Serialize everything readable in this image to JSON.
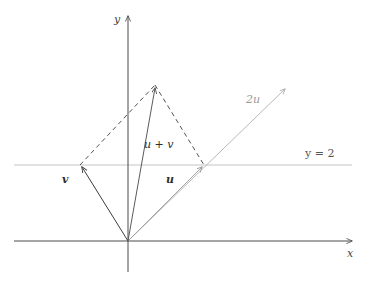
{
  "figure": {
    "background_color": "#ffffff"
  },
  "axes": {
    "x_label": "x",
    "y_label": "y",
    "axis_color": "#4a4a4a",
    "origin": {
      "x": 128,
      "y": 241
    },
    "x_axis": {
      "x_start": 14,
      "x_end": 356,
      "y": 241,
      "arrow": "right"
    },
    "y_axis": {
      "x": 128,
      "y_start": 272,
      "y_end": 12,
      "arrow": "up"
    }
  },
  "reference_line": {
    "label": "y = 2",
    "label_html": "y = 2",
    "y_pixel": 165,
    "x_start": 14,
    "x_end": 352,
    "color": "#b9b9b9"
  },
  "vectors": [
    {
      "name": "v",
      "label": "v",
      "from": {
        "x": 128,
        "y": 241
      },
      "to": {
        "x": 80,
        "y": 165
      },
      "style": "solid",
      "color": "#3d3d3d",
      "arrow": true,
      "label_pos": {
        "x": 62,
        "y": 174
      }
    },
    {
      "name": "u",
      "label": "u",
      "from": {
        "x": 128,
        "y": 241
      },
      "to": {
        "x": 204,
        "y": 165
      },
      "style": "solid",
      "color": "#9a9a9a",
      "arrow": true,
      "label_pos": {
        "x": 166,
        "y": 174
      }
    },
    {
      "name": "u-plus-v",
      "label": "u + v",
      "from": {
        "x": 128,
        "y": 241
      },
      "to": {
        "x": 155,
        "y": 85
      },
      "style": "solid",
      "color": "#5a5a5a",
      "arrow": true,
      "label_pos": {
        "x": 144,
        "y": 139
      }
    },
    {
      "name": "two-u",
      "label": "2u",
      "from": {
        "x": 128,
        "y": 241
      },
      "to": {
        "x": 288,
        "y": 86
      },
      "style": "solid",
      "color": "#b0b0b0",
      "arrow": true,
      "label_pos": {
        "x": 246,
        "y": 94
      }
    }
  ],
  "construction_lines": [
    {
      "name": "dashed-v-to-apex",
      "from": {
        "x": 80,
        "y": 165
      },
      "to": {
        "x": 155,
        "y": 85
      },
      "style": "dashed",
      "color": "#3d3d3d"
    },
    {
      "name": "dashed-apex-to-u",
      "from": {
        "x": 155,
        "y": 85
      },
      "to": {
        "x": 204,
        "y": 165
      },
      "style": "dashed",
      "color": "#3d3d3d"
    }
  ],
  "colors": {
    "ink": "#3d3d3d",
    "grey_line": "#b9b9b9",
    "light_vector": "#9a9a9a",
    "axis": "#4a4a4a"
  }
}
